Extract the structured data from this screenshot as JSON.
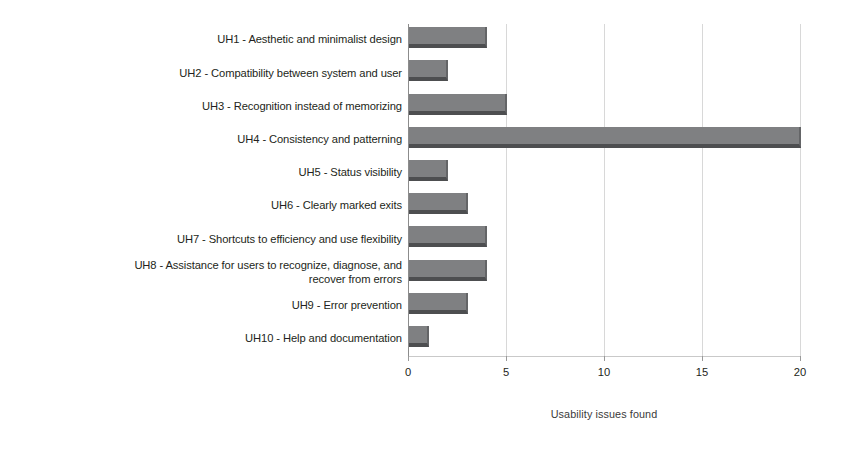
{
  "chart_data": {
    "type": "bar",
    "orientation": "horizontal",
    "title": "",
    "subtitle": "",
    "xlabel": "Usability issues found",
    "ylabel": "",
    "xlim": [
      0,
      20
    ],
    "xticks": [
      0,
      5,
      10,
      15,
      20
    ],
    "xtick_labels": [
      "0",
      "5",
      "10",
      "15",
      "20"
    ],
    "grid": "vertical",
    "legend": "none",
    "bar_color": "#7f8082",
    "bar_shadow_color": "#4d4e50",
    "categories": [
      "UH1 - Aesthetic and minimalist design",
      "UH2 - Compatibility between system and user",
      "UH3 - Recognition instead of memorizing",
      "UH4 - Consistency and patterning",
      "UH5 - Status visibility",
      "UH6 - Clearly marked exits",
      "UH7 - Shortcuts to efficiency and use flexibility",
      "UH8 - Assistance for users to recognize, diagnose, and\nrecover from errors",
      "UH9 - Error prevention",
      "UH10 - Help and documentation"
    ],
    "values": [
      4,
      2,
      5,
      20,
      2,
      3,
      4,
      4,
      3,
      1
    ]
  }
}
